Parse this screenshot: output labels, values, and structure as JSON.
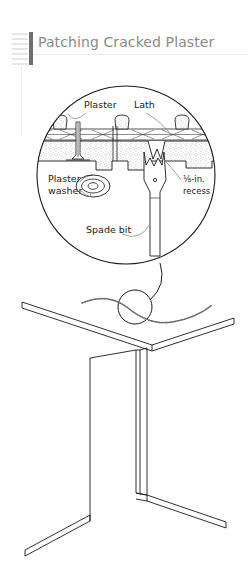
{
  "page": {
    "background": "#ffffff",
    "width": 251,
    "height": 581,
    "top_faded_text": "",
    "title": "Patching Cracked Plaster",
    "title_color": "#8a8a8a",
    "rule_color": "#e9e9e9",
    "rail_bar_color": "#6f6f6f"
  },
  "figure": {
    "name": "patching-cracked-plaster-illustration",
    "line_color": "#1a1a1a",
    "leader_color": "#8c8c8c",
    "detail_circle": {
      "cx": 126,
      "cy": 115,
      "r": 90
    },
    "labels": [
      {
        "id": "plaster",
        "text": "Plaster",
        "x": 84,
        "y": 48
      },
      {
        "id": "lath",
        "text": "Lath",
        "x": 134,
        "y": 48
      },
      {
        "id": "plaster-washer",
        "line1": "Plaster",
        "line2": "washer",
        "x": 48,
        "y": 122
      },
      {
        "id": "recess",
        "line1": "⅛-in.",
        "line2": "recess",
        "x": 183,
        "y": 122
      },
      {
        "id": "spade-bit",
        "text": "Spade bit",
        "x": 86,
        "y": 173
      }
    ],
    "room": {
      "name": "ceiling-and-wall-corner",
      "crack_label": "hairline-crack"
    }
  }
}
